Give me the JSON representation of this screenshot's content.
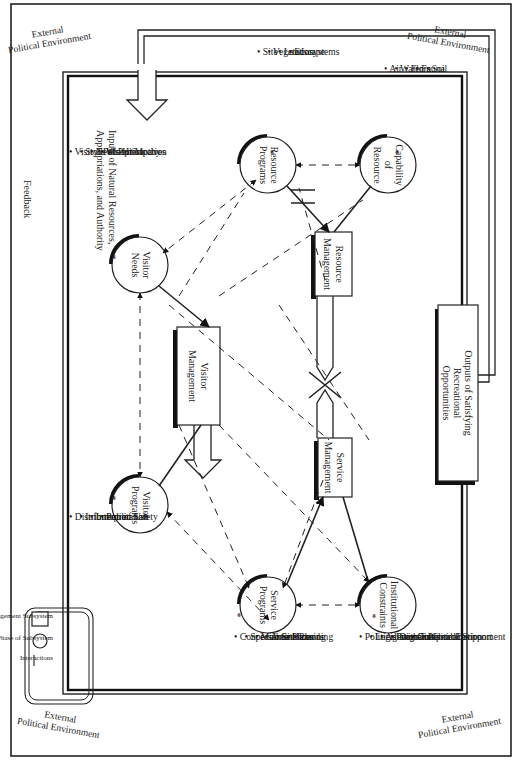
{
  "environment_labels": [
    {
      "line1": "External",
      "line2": "Political Environment",
      "corner": "top-left"
    },
    {
      "line1": "External",
      "line2": "Political Environment",
      "corner": "top-right"
    },
    {
      "line1": "External",
      "line2": "Political Environment",
      "corner": "bottom-left"
    },
    {
      "line1": "External",
      "line2": "Political Environment",
      "corner": "bottom-right"
    }
  ],
  "inputs_label": {
    "line1": "Inputs of Natural Resources,",
    "line2": "Appropriations, and Authority"
  },
  "feedback_label": "Feedback",
  "outputs_box": {
    "line1": "Outputs of Satisfying",
    "line2": "Recreational",
    "line3": "Opportunities"
  },
  "management_subsystems": [
    {
      "id": "visitor",
      "line1": "Visitor",
      "line2": "Management"
    },
    {
      "id": "resource",
      "line1": "Resource",
      "line2": "Management"
    },
    {
      "id": "service",
      "line1": "Service",
      "line2": "Management"
    }
  ],
  "phases": [
    {
      "id": "visitor-needs",
      "line1": "Visitor",
      "line2": "Needs",
      "line3": ""
    },
    {
      "id": "visitor-programs",
      "line1": "Visitor",
      "line2": "Programs",
      "line3": ""
    },
    {
      "id": "resource-programs",
      "line1": "Resource",
      "line2": "Programs",
      "line3": ""
    },
    {
      "id": "capability-of-resource",
      "line1": "Capability",
      "line2": "of",
      "line3": "Resource"
    },
    {
      "id": "service-programs",
      "line1": "Service",
      "line2": "Programs",
      "line3": ""
    },
    {
      "id": "institutional-constraints",
      "line1": "Institutional",
      "line2": "Constraints",
      "line3": ""
    }
  ],
  "lists": {
    "visitor_needs": [
      "• Visitor Perception",
      "• Style of Participation",
      "• Needs Hierarchy",
      "• Visitor Motives"
    ],
    "resource_programs": [
      "• Site",
      "• Vegetation",
      "• Landscape",
      "• Ecosystems"
    ],
    "capability_of_resource": [
      "• Air",
      "• Water",
      "• Flora",
      "• Fauna",
      "• Soil"
    ],
    "visitor_programs": [
      "• Distribution of Use",
      "• Information",
      "• Interpretation",
      "• Public Safety"
    ],
    "service_programs": [
      "• Concessions",
      "• Special Services",
      "• Maintenance",
      "• Area Planning",
      "• Site Planning",
      "• Hazards"
    ],
    "institutional_constraints": [
      "• Political Demands",
      "• Legislation",
      "• Agency Goals",
      "• Program Coordination",
      "   with External Environment",
      "• Competence",
      "• Political Support"
    ]
  },
  "asterisk": "*",
  "legend": {
    "items": [
      {
        "symbol": "rectangle",
        "label": "Management Subsystem"
      },
      {
        "symbol": "circle",
        "label": "Phase of Subsystem"
      },
      {
        "symbol": "line",
        "label": "Interactions"
      }
    ]
  }
}
